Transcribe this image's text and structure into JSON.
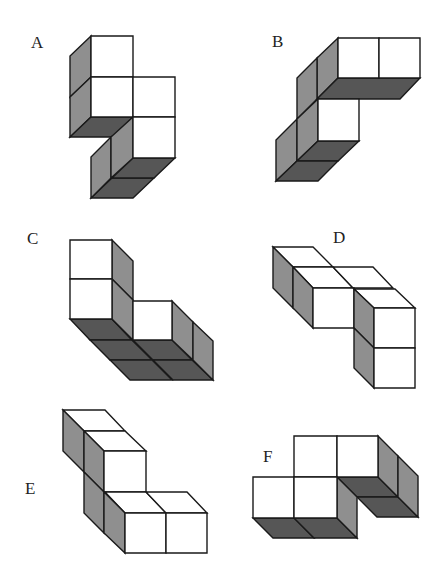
{
  "colors": {
    "white": "#ffffff",
    "grey": "#8f8f8f",
    "dark": "#565656",
    "stroke": "#1a1a1a"
  },
  "figures": [
    {
      "label": "A",
      "label_pos": [
        31,
        34
      ],
      "faces": [
        {
          "fill": "grey",
          "points": "91,36 70,56 70,97 91,77"
        },
        {
          "fill": "grey",
          "points": "91,77 70,97 70,137 91,117"
        },
        {
          "fill": "dark",
          "points": "91,117 133,117 112,137 70,137"
        },
        {
          "fill": "white",
          "points": "91,36 133,36 133,77 91,77"
        },
        {
          "fill": "white",
          "points": "91,77 133,77 133,117 91,117"
        },
        {
          "fill": "white",
          "points": "133,77 175,77 175,117 133,117"
        },
        {
          "fill": "dark",
          "points": "112,178 154,178 133,198 91,198"
        },
        {
          "fill": "dark",
          "points": "133,158 175,158 154,178 112,178"
        },
        {
          "fill": "grey",
          "points": "111,137 91,157 91,198 111,178"
        },
        {
          "fill": "grey",
          "points": "133,117 111,137 111,178 133,158"
        },
        {
          "fill": "white",
          "points": "133,117 175,117 175,158 133,158"
        }
      ]
    },
    {
      "label": "B",
      "label_pos": [
        272,
        33
      ],
      "faces": [
        {
          "fill": "grey",
          "points": "338,38 317,58 317,99 338,78"
        },
        {
          "fill": "grey",
          "points": "317,58 297,78 297,119 317,99"
        },
        {
          "fill": "dark",
          "points": "338,78 420,78 400,99 317,99"
        },
        {
          "fill": "white",
          "points": "338,38 379,38 379,78 338,78"
        },
        {
          "fill": "white",
          "points": "379,38 420,38 420,78 379,78"
        },
        {
          "fill": "grey",
          "points": "297,119 276,140 276,181 297,161"
        },
        {
          "fill": "grey",
          "points": "318,99 297,119 297,161 318,141"
        },
        {
          "fill": "dark",
          "points": "318,141 359,141 338,161 297,161"
        },
        {
          "fill": "dark",
          "points": "297,161 338,161 318,181 276,181"
        },
        {
          "fill": "white",
          "points": "318,99 359,99 359,141 318,141"
        }
      ]
    },
    {
      "label": "C",
      "label_pos": [
        27,
        230
      ],
      "faces": [
        {
          "fill": "dark",
          "points": "70,319 112,319 132,340 90,340"
        },
        {
          "fill": "dark",
          "points": "90,340 132,340 152,360 110,360"
        },
        {
          "fill": "dark",
          "points": "112,319 133,340 153,360 132,340"
        },
        {
          "fill": "grey",
          "points": "112,240 133,261 133,300 112,279"
        },
        {
          "fill": "grey",
          "points": "112,279 133,300 133,340 112,319"
        },
        {
          "fill": "white",
          "points": "70,240 112,240 112,279 70,279"
        },
        {
          "fill": "white",
          "points": "70,279 112,279 112,319 70,319"
        },
        {
          "fill": "dark",
          "points": "133,340 172,340 192,360 153,360"
        },
        {
          "fill": "dark",
          "points": "153,360 192,360 213,380 173,380"
        },
        {
          "fill": "dark",
          "points": "110,360 152,360 172,380 130,380"
        },
        {
          "fill": "grey",
          "points": "172,301 193,322 193,360 172,340"
        },
        {
          "fill": "grey",
          "points": "193,322 213,341 213,380 193,360"
        },
        {
          "fill": "white",
          "points": "133,301 172,301 172,340 133,340"
        }
      ]
    },
    {
      "label": "D",
      "label_pos": [
        333,
        229
      ],
      "faces": [
        {
          "fill": "white",
          "points": "273,247 313,247 333,267 293,267"
        },
        {
          "fill": "white",
          "points": "293,267 333,267 353,288 313,288"
        },
        {
          "fill": "white",
          "points": "333,267 373,267 393,288 353,288"
        },
        {
          "fill": "grey",
          "points": "273,247 293,267 293,308 273,288"
        },
        {
          "fill": "grey",
          "points": "293,267 313,288 313,328 293,308"
        },
        {
          "fill": "white",
          "points": "313,288 354,288 354,328 313,328"
        },
        {
          "fill": "white",
          "points": "354,289 395,289 415,308 374,308"
        },
        {
          "fill": "grey",
          "points": "354,289 374,308 374,348 354,328"
        },
        {
          "fill": "grey",
          "points": "354,328 374,348 374,388 354,368"
        },
        {
          "fill": "white",
          "points": "374,308 415,308 415,348 374,348"
        },
        {
          "fill": "white",
          "points": "374,348 415,348 415,388 374,388"
        }
      ]
    },
    {
      "label": "E",
      "label_pos": [
        25,
        480
      ],
      "faces": [
        {
          "fill": "white",
          "points": "63,410 105,410 125,431 84,431"
        },
        {
          "fill": "white",
          "points": "84,431 125,431 146,451 104,451"
        },
        {
          "fill": "grey",
          "points": "63,410 84,431 84,472 63,451"
        },
        {
          "fill": "grey",
          "points": "84,431 104,451 104,492 84,472"
        },
        {
          "fill": "white",
          "points": "104,451 146,451 146,492 104,492"
        },
        {
          "fill": "white",
          "points": "105,492 146,492 166,513 125,513"
        },
        {
          "fill": "white",
          "points": "146,492 187,492 207,513 166,513"
        },
        {
          "fill": "grey",
          "points": "84,472 104,492 104,533 84,513"
        },
        {
          "fill": "grey",
          "points": "104,492 125,513 125,553 104,533"
        },
        {
          "fill": "white",
          "points": "125,513 166,513 166,553 125,553"
        },
        {
          "fill": "white",
          "points": "166,513 207,513 207,553 166,553"
        }
      ]
    },
    {
      "label": "F",
      "label_pos": [
        263,
        448
      ],
      "faces": [
        {
          "fill": "dark",
          "points": "337,477 378,477 398,497 357,497"
        },
        {
          "fill": "dark",
          "points": "357,497 398,497 418,517 377,517"
        },
        {
          "fill": "grey",
          "points": "378,436 398,456 398,497 378,477"
        },
        {
          "fill": "grey",
          "points": "398,456 418,476 418,517 398,497"
        },
        {
          "fill": "white",
          "points": "294,436 337,436 337,477 294,477"
        },
        {
          "fill": "white",
          "points": "337,436 378,436 378,477 337,477"
        },
        {
          "fill": "dark",
          "points": "253,518 294,518 314,538 273,538"
        },
        {
          "fill": "dark",
          "points": "294,518 337,518 357,538 314,538"
        },
        {
          "fill": "grey",
          "points": "337,477 357,497 357,538 337,518"
        },
        {
          "fill": "white",
          "points": "253,477 294,477 294,518 253,518"
        },
        {
          "fill": "white",
          "points": "294,477 337,477 337,518 294,518"
        }
      ]
    }
  ]
}
